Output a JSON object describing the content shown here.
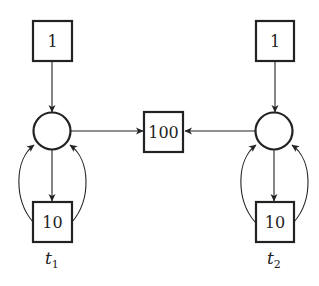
{
  "diagram": {
    "type": "petri-net",
    "nodes": {
      "top_left_box": {
        "label": "1"
      },
      "top_right_box": {
        "label": "1"
      },
      "center_box": {
        "label": "100"
      },
      "bottom_left_box": {
        "label": "10"
      },
      "bottom_right_box": {
        "label": "10"
      },
      "left_place": {
        "label": ""
      },
      "right_place": {
        "label": ""
      }
    },
    "labels": {
      "t1": {
        "base": "t",
        "sub": "1"
      },
      "t2": {
        "base": "t",
        "sub": "2"
      }
    },
    "edges": [
      {
        "from": "top_left_box",
        "to": "left_place"
      },
      {
        "from": "left_place",
        "to": "center_box"
      },
      {
        "from": "left_place",
        "to": "bottom_left_box"
      },
      {
        "from": "bottom_left_box",
        "to": "left_place",
        "curve": "left"
      },
      {
        "from": "bottom_left_box",
        "to": "left_place",
        "curve": "right"
      },
      {
        "from": "top_right_box",
        "to": "right_place"
      },
      {
        "from": "right_place",
        "to": "center_box"
      },
      {
        "from": "right_place",
        "to": "bottom_right_box"
      },
      {
        "from": "bottom_right_box",
        "to": "right_place",
        "curve": "left"
      },
      {
        "from": "bottom_right_box",
        "to": "right_place",
        "curve": "right"
      }
    ]
  }
}
